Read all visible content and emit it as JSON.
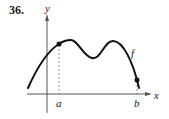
{
  "problem_number": "36.",
  "axes": {
    "x_label": "x",
    "y_label": "y"
  },
  "function_label": "f",
  "points": [
    {
      "label": "a",
      "x": 59,
      "y": 44
    },
    {
      "label": "b",
      "x": 137,
      "y": 80
    }
  ],
  "colors": {
    "curve": "#111111",
    "axis": "#555555",
    "dashed": "#777777"
  }
}
